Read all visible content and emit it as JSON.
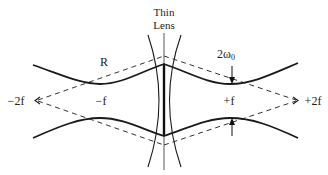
{
  "diagram": {
    "title_line1": "Thin",
    "title_line2": "Lens",
    "labels": {
      "radius": "R",
      "waist": "2ω",
      "waist_sub": "0",
      "minus_f": "−f",
      "plus_f": "+f",
      "minus_2f": "−2f",
      "plus_2f": "+2f"
    },
    "colors": {
      "line": "#1a1a1a",
      "background": "#ffffff"
    }
  }
}
